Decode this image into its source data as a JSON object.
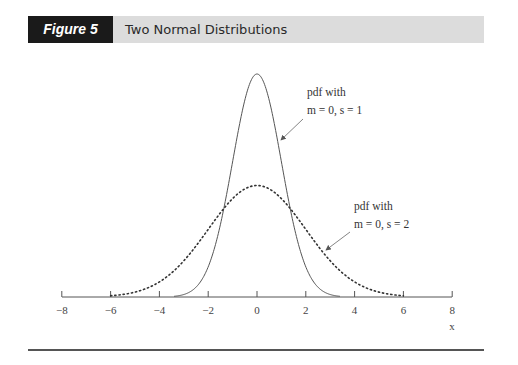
{
  "header": {
    "figure_label": "Figure 5",
    "title": "Two Normal Distributions"
  },
  "chart_data": {
    "type": "line",
    "title": "Two Normal Distributions",
    "xlabel": "x",
    "ylabel": "",
    "xlim": [
      -8,
      8
    ],
    "xticks": [
      -8,
      -6,
      -4,
      -2,
      0,
      2,
      4,
      6,
      8
    ],
    "grid": false,
    "series": [
      {
        "name": "pdf with m = 0, s = 1",
        "mean": 0,
        "sd": 1,
        "style": "solid",
        "peak": 0.399
      },
      {
        "name": "pdf with m = 0, s = 2",
        "mean": 0,
        "sd": 2,
        "style": "dotted",
        "peak": 0.199
      }
    ],
    "annotations": [
      {
        "line1": "pdf with",
        "line2": "m = 0, s = 1",
        "target_series": 0
      },
      {
        "line1": "pdf with",
        "line2": "m = 0, s = 2",
        "target_series": 1
      }
    ]
  }
}
